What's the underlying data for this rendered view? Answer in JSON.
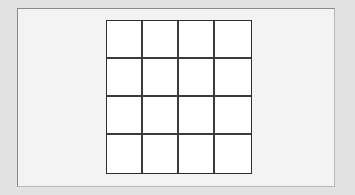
{
  "canvas": {
    "background": "#e2e2e2",
    "panel_background": "#f3f3f3"
  },
  "grid": {
    "rows": 4,
    "columns": 4,
    "line_color": "#2e2e2e",
    "cell_color": "#ffffff",
    "cells": [
      [
        "",
        "",
        "",
        ""
      ],
      [
        "",
        "",
        "",
        ""
      ],
      [
        "",
        "",
        "",
        ""
      ],
      [
        "",
        "",
        "",
        ""
      ]
    ]
  }
}
